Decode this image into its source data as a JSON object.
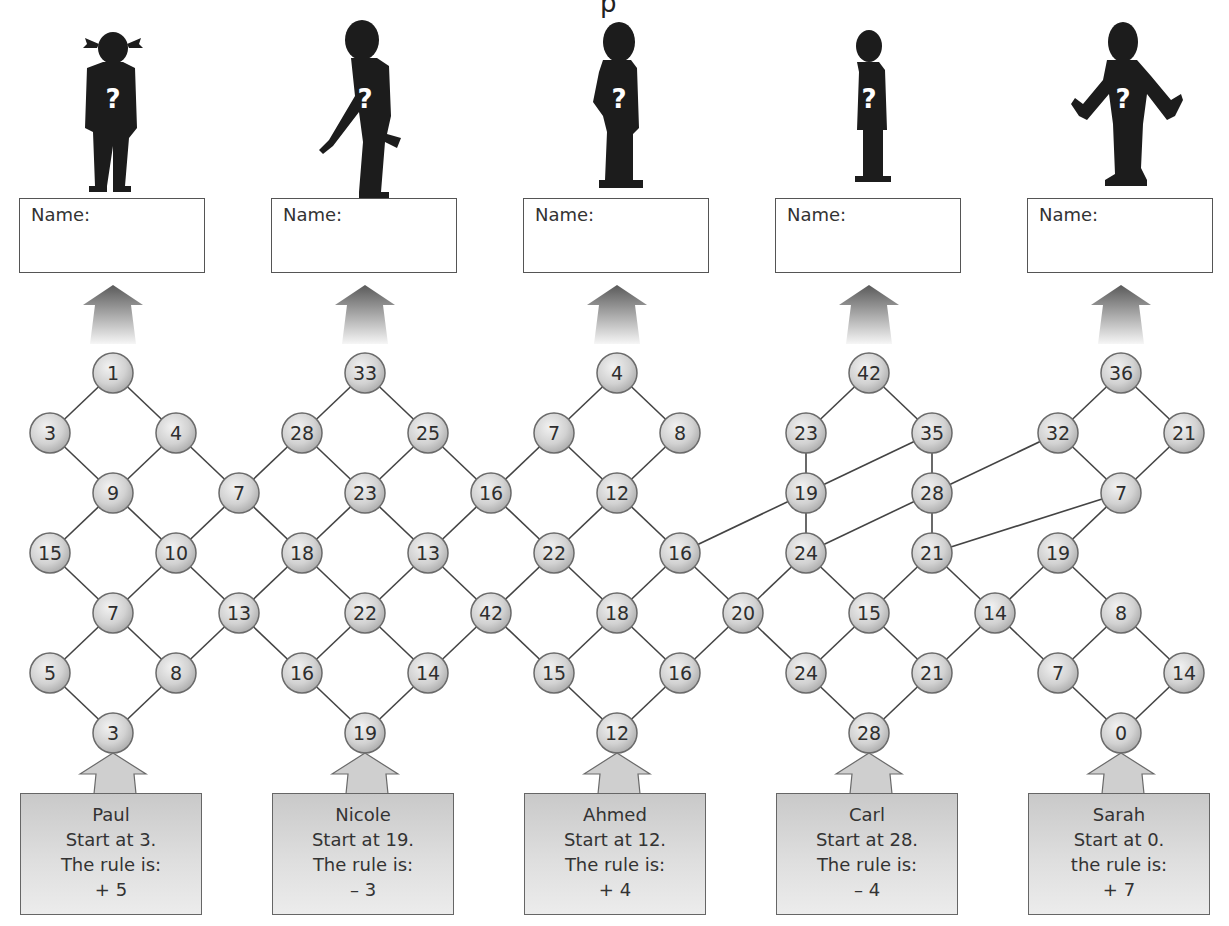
{
  "title_fragment": "p",
  "name_label": "Name:",
  "characters": [
    {
      "id": "girl-pigtails",
      "cx": 113,
      "pose": "standing"
    },
    {
      "id": "boy-pointing",
      "cx": 365,
      "pose": "pointing"
    },
    {
      "id": "boy-hand-on-hip",
      "cx": 617,
      "pose": "hand-on-hip"
    },
    {
      "id": "girl-skirt",
      "cx": 869,
      "pose": "standing"
    },
    {
      "id": "boy-arms-open",
      "cx": 1121,
      "pose": "arms-open"
    }
  ],
  "name_boxes": [
    {
      "x": 19,
      "label": "Name:"
    },
    {
      "x": 271,
      "label": "Name:"
    },
    {
      "x": 523,
      "label": "Name:"
    },
    {
      "x": 775,
      "label": "Name:"
    },
    {
      "x": 1027,
      "label": "Name:"
    }
  ],
  "rule_cards": [
    {
      "x": 20,
      "cx": 113,
      "name": "Paul",
      "start": "Start at 3.",
      "rule_label": "The rule is:",
      "rule": "+ 5"
    },
    {
      "x": 272,
      "cx": 365,
      "name": "Nicole",
      "start": "Start at 19.",
      "rule_label": "The rule is:",
      "rule": "– 3"
    },
    {
      "x": 524,
      "cx": 617,
      "name": "Ahmed",
      "start": "Start at 12.",
      "rule_label": "The rule is:",
      "rule": "+ 4"
    },
    {
      "x": 776,
      "cx": 869,
      "name": "Carl",
      "start": "Start at 28.",
      "rule_label": "The rule is:",
      "rule": "– 4"
    },
    {
      "x": 1028,
      "cx": 1121,
      "name": "Sarah",
      "start": "Start at 0.",
      "rule_label": "the rule is:",
      "rule": "+ 7"
    }
  ],
  "graph": {
    "node_radius": 20,
    "colors": {
      "node_fill": "#d4d4d4",
      "node_stroke": "#6a6a6a",
      "edge": "#444444",
      "text": "#2e2e2e"
    },
    "nodes": [
      {
        "id": "a",
        "v": "1",
        "x": 113,
        "y": 373
      },
      {
        "id": "b",
        "v": "33",
        "x": 365,
        "y": 373
      },
      {
        "id": "c",
        "v": "4",
        "x": 617,
        "y": 373
      },
      {
        "id": "d",
        "v": "42",
        "x": 869,
        "y": 373
      },
      {
        "id": "e",
        "v": "36",
        "x": 1121,
        "y": 373
      },
      {
        "id": "f",
        "v": "3",
        "x": 50,
        "y": 433
      },
      {
        "id": "g",
        "v": "4",
        "x": 176,
        "y": 433
      },
      {
        "id": "h",
        "v": "28",
        "x": 302,
        "y": 433
      },
      {
        "id": "i",
        "v": "25",
        "x": 428,
        "y": 433
      },
      {
        "id": "j",
        "v": "7",
        "x": 554,
        "y": 433
      },
      {
        "id": "k",
        "v": "8",
        "x": 680,
        "y": 433
      },
      {
        "id": "l",
        "v": "23",
        "x": 806,
        "y": 433
      },
      {
        "id": "m",
        "v": "35",
        "x": 932,
        "y": 433
      },
      {
        "id": "n",
        "v": "32",
        "x": 1058,
        "y": 433
      },
      {
        "id": "o",
        "v": "21",
        "x": 1184,
        "y": 433
      },
      {
        "id": "p",
        "v": "9",
        "x": 113,
        "y": 493
      },
      {
        "id": "q",
        "v": "7",
        "x": 239,
        "y": 493
      },
      {
        "id": "r",
        "v": "23",
        "x": 365,
        "y": 493
      },
      {
        "id": "s",
        "v": "16",
        "x": 491,
        "y": 493
      },
      {
        "id": "t",
        "v": "12",
        "x": 617,
        "y": 493
      },
      {
        "id": "u",
        "v": "19",
        "x": 806,
        "y": 493
      },
      {
        "id": "w",
        "v": "28",
        "x": 932,
        "y": 493
      },
      {
        "id": "x",
        "v": "7",
        "x": 1121,
        "y": 493
      },
      {
        "id": "A",
        "v": "15",
        "x": 50,
        "y": 553
      },
      {
        "id": "B",
        "v": "10",
        "x": 176,
        "y": 553
      },
      {
        "id": "C",
        "v": "18",
        "x": 302,
        "y": 553
      },
      {
        "id": "D",
        "v": "13",
        "x": 428,
        "y": 553
      },
      {
        "id": "E",
        "v": "22",
        "x": 554,
        "y": 553
      },
      {
        "id": "F",
        "v": "16",
        "x": 680,
        "y": 553
      },
      {
        "id": "G",
        "v": "24",
        "x": 806,
        "y": 553
      },
      {
        "id": "H",
        "v": "21",
        "x": 932,
        "y": 553
      },
      {
        "id": "I",
        "v": "19",
        "x": 1058,
        "y": 553
      },
      {
        "id": "J",
        "v": "7",
        "x": 113,
        "y": 613
      },
      {
        "id": "K",
        "v": "13",
        "x": 239,
        "y": 613
      },
      {
        "id": "L",
        "v": "22",
        "x": 365,
        "y": 613
      },
      {
        "id": "M",
        "v": "42",
        "x": 491,
        "y": 613
      },
      {
        "id": "N",
        "v": "18",
        "x": 617,
        "y": 613
      },
      {
        "id": "O",
        "v": "20",
        "x": 743,
        "y": 613
      },
      {
        "id": "P",
        "v": "15",
        "x": 869,
        "y": 613
      },
      {
        "id": "Q",
        "v": "14",
        "x": 995,
        "y": 613
      },
      {
        "id": "R",
        "v": "8",
        "x": 1121,
        "y": 613
      },
      {
        "id": "S",
        "v": "5",
        "x": 50,
        "y": 673
      },
      {
        "id": "T",
        "v": "8",
        "x": 176,
        "y": 673
      },
      {
        "id": "U",
        "v": "16",
        "x": 302,
        "y": 673
      },
      {
        "id": "V",
        "v": "14",
        "x": 428,
        "y": 673
      },
      {
        "id": "W",
        "v": "15",
        "x": 554,
        "y": 673
      },
      {
        "id": "X",
        "v": "16",
        "x": 680,
        "y": 673
      },
      {
        "id": "Y",
        "v": "24",
        "x": 806,
        "y": 673
      },
      {
        "id": "Z",
        "v": "21",
        "x": 932,
        "y": 673
      },
      {
        "id": "aa",
        "v": "7",
        "x": 1058,
        "y": 673
      },
      {
        "id": "ab",
        "v": "14",
        "x": 1184,
        "y": 673
      },
      {
        "id": "ac",
        "v": "3",
        "x": 113,
        "y": 733
      },
      {
        "id": "ad",
        "v": "19",
        "x": 365,
        "y": 733
      },
      {
        "id": "ae",
        "v": "12",
        "x": 617,
        "y": 733
      },
      {
        "id": "af",
        "v": "28",
        "x": 869,
        "y": 733
      },
      {
        "id": "ag",
        "v": "0",
        "x": 1121,
        "y": 733
      }
    ],
    "edges": [
      [
        "a",
        "f"
      ],
      [
        "a",
        "g"
      ],
      [
        "f",
        "p"
      ],
      [
        "g",
        "p"
      ],
      [
        "g",
        "q"
      ],
      [
        "p",
        "A"
      ],
      [
        "p",
        "B"
      ],
      [
        "q",
        "B"
      ],
      [
        "q",
        "h"
      ],
      [
        "A",
        "J"
      ],
      [
        "B",
        "J"
      ],
      [
        "B",
        "K"
      ],
      [
        "J",
        "S"
      ],
      [
        "J",
        "T"
      ],
      [
        "S",
        "ac"
      ],
      [
        "T",
        "ac"
      ],
      [
        "T",
        "K"
      ],
      [
        "b",
        "h"
      ],
      [
        "b",
        "i"
      ],
      [
        "h",
        "r"
      ],
      [
        "i",
        "r"
      ],
      [
        "i",
        "s"
      ],
      [
        "r",
        "C"
      ],
      [
        "r",
        "D"
      ],
      [
        "q",
        "C"
      ],
      [
        "C",
        "K"
      ],
      [
        "C",
        "L"
      ],
      [
        "D",
        "L"
      ],
      [
        "D",
        "M"
      ],
      [
        "s",
        "D"
      ],
      [
        "K",
        "U"
      ],
      [
        "L",
        "U"
      ],
      [
        "L",
        "V"
      ],
      [
        "U",
        "ad"
      ],
      [
        "V",
        "ad"
      ],
      [
        "V",
        "M"
      ],
      [
        "c",
        "j"
      ],
      [
        "c",
        "k"
      ],
      [
        "j",
        "s"
      ],
      [
        "j",
        "t"
      ],
      [
        "k",
        "t"
      ],
      [
        "s",
        "E"
      ],
      [
        "t",
        "E"
      ],
      [
        "t",
        "F"
      ],
      [
        "E",
        "M"
      ],
      [
        "E",
        "N"
      ],
      [
        "F",
        "N"
      ],
      [
        "F",
        "O"
      ],
      [
        "M",
        "W"
      ],
      [
        "N",
        "W"
      ],
      [
        "N",
        "X"
      ],
      [
        "W",
        "ae"
      ],
      [
        "X",
        "ae"
      ],
      [
        "X",
        "O"
      ],
      [
        "d",
        "l"
      ],
      [
        "d",
        "m"
      ],
      [
        "l",
        "u"
      ],
      [
        "m",
        "u"
      ],
      [
        "m",
        "w"
      ],
      [
        "u",
        "G"
      ],
      [
        "u",
        "F"
      ],
      [
        "w",
        "G"
      ],
      [
        "w",
        "H"
      ],
      [
        "w",
        "n"
      ],
      [
        "G",
        "O"
      ],
      [
        "G",
        "P"
      ],
      [
        "O",
        "Y"
      ],
      [
        "H",
        "P"
      ],
      [
        "H",
        "Q"
      ],
      [
        "H",
        "x"
      ],
      [
        "P",
        "Y"
      ],
      [
        "P",
        "Z"
      ],
      [
        "Y",
        "af"
      ],
      [
        "Z",
        "af"
      ],
      [
        "Z",
        "Q"
      ],
      [
        "e",
        "n"
      ],
      [
        "e",
        "o"
      ],
      [
        "n",
        "x"
      ],
      [
        "o",
        "x"
      ],
      [
        "x",
        "I"
      ],
      [
        "I",
        "Q"
      ],
      [
        "I",
        "R"
      ],
      [
        "Q",
        "aa"
      ],
      [
        "R",
        "aa"
      ],
      [
        "R",
        "ab"
      ],
      [
        "aa",
        "ag"
      ],
      [
        "ab",
        "ag"
      ]
    ]
  }
}
